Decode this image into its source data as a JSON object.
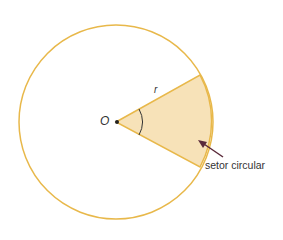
{
  "diagram": {
    "center_label": "O",
    "radius_label": "r",
    "sector_label": "setor circular",
    "colors": {
      "circle_stroke": "#e8b84a",
      "sector_fill": "#f7e2b8",
      "arrow": "#5a2a3a",
      "text": "#333333"
    }
  }
}
